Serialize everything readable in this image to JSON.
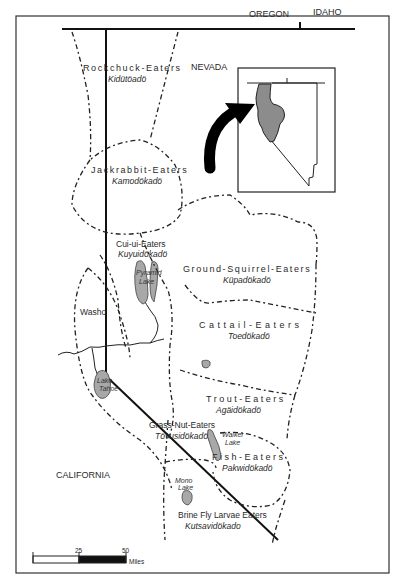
{
  "map": {
    "states": {
      "oregon": "OREGON",
      "idaho": "IDAHO",
      "nevada": "NEVADA",
      "california": "CALIFORNIA"
    },
    "territories": [
      {
        "english": "Rockchuck-Eaters",
        "native": "Kidütöadö"
      },
      {
        "english": "Jackrabbit-Eaters",
        "native": "Kamodökadö"
      },
      {
        "english": "Cui-ui-Eaters",
        "native": "Kuyuidökadö"
      },
      {
        "english": "Ground-Squirrel-Eaters",
        "native": "Küpadökadö"
      },
      {
        "english": "Cattail-Eaters",
        "native": "Toedökadö"
      },
      {
        "english": "Washo",
        "native": ""
      },
      {
        "english": "Trout-Eaters",
        "native": "Agäidökadö"
      },
      {
        "english": "Grass-Nut-Eaters",
        "native": "Tövusidökadö"
      },
      {
        "english": "Fish-Eaters",
        "native": "Pakwidökadö"
      },
      {
        "english": "Brine Fly Larvae Eaters",
        "native": "Kutsavidökado"
      }
    ],
    "lakes": [
      {
        "name_line1": "Pyramid",
        "name_line2": "Lake"
      },
      {
        "name_line1": "Lake",
        "name_line2": "Tahoe"
      },
      {
        "name_line1": "Walker",
        "name_line2": "Lake"
      },
      {
        "name_line1": "Mono",
        "name_line2": "Lake"
      }
    ],
    "scale_bar": {
      "tick_0": "",
      "tick_25": "25",
      "tick_50": "50",
      "unit": "Miles"
    },
    "inset": {
      "description": "Nevada locator inset with shaded study area and arrow"
    },
    "colors": {
      "ink": "#222222",
      "lake_fill": "#a8a8a8",
      "inset_shade": "#8c8c8c",
      "background": "#ffffff"
    }
  }
}
